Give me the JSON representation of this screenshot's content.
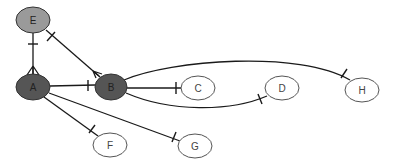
{
  "diagram": {
    "type": "entity-relationship graph",
    "nodes": [
      {
        "id": "E",
        "label": "E",
        "cx": 33,
        "cy": 20,
        "rx": 17,
        "ry": 13,
        "fill": "#9a9a9a",
        "text": "#222222"
      },
      {
        "id": "A",
        "label": "A",
        "cx": 33,
        "cy": 87,
        "rx": 17,
        "ry": 13,
        "fill": "#555555",
        "text": "#222222"
      },
      {
        "id": "B",
        "label": "B",
        "cx": 111,
        "cy": 87,
        "rx": 16,
        "ry": 13,
        "fill": "#555555",
        "text": "#222222"
      },
      {
        "id": "C",
        "label": "C",
        "cx": 198,
        "cy": 88,
        "rx": 17,
        "ry": 12,
        "fill": "#ffffff",
        "text": "#444444"
      },
      {
        "id": "D",
        "label": "D",
        "cx": 282,
        "cy": 88,
        "rx": 17,
        "ry": 12,
        "fill": "#ffffff",
        "text": "#444444"
      },
      {
        "id": "H",
        "label": "H",
        "cx": 362,
        "cy": 90,
        "rx": 17,
        "ry": 12,
        "fill": "#ffffff",
        "text": "#444444"
      },
      {
        "id": "F",
        "label": "F",
        "cx": 110,
        "cy": 145,
        "rx": 17,
        "ry": 12,
        "fill": "#ffffff",
        "text": "#444444"
      },
      {
        "id": "G",
        "label": "G",
        "cx": 195,
        "cy": 146,
        "rx": 17,
        "ry": 12,
        "fill": "#ffffff",
        "text": "#444444"
      }
    ],
    "edges": [
      {
        "from": "A",
        "to": "E",
        "start": "crow-foot",
        "end": "one"
      },
      {
        "from": "B",
        "to": "E",
        "start": "crow-foot",
        "end": "one"
      },
      {
        "from": "A",
        "to": "B",
        "start": "none",
        "end": "one"
      },
      {
        "from": "B",
        "to": "C",
        "start": "none",
        "end": "one"
      },
      {
        "from": "B",
        "to": "D",
        "start": "none",
        "end": "one"
      },
      {
        "from": "B",
        "to": "H",
        "start": "none",
        "end": "one"
      },
      {
        "from": "A",
        "to": "F",
        "start": "none",
        "end": "one"
      },
      {
        "from": "A",
        "to": "G",
        "start": "none",
        "end": "one"
      }
    ]
  }
}
